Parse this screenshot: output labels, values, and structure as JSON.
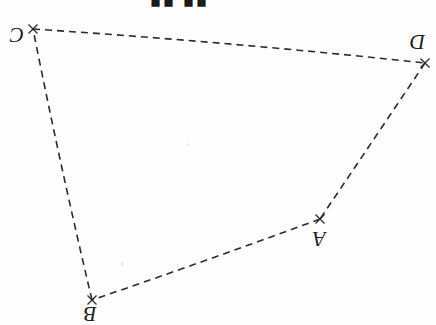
{
  "figure": {
    "title_fragment": "▮▮ ▮▮",
    "canvas": {
      "width": 436,
      "height": 325
    },
    "background_color": "#fefefe",
    "stroke_color": "#2b2b2b",
    "stroke_width": 1.6,
    "dash_pattern": "7 5",
    "marker_style": "x-cross",
    "label_rotation_degrees": 180,
    "vertices": [
      {
        "id": "A",
        "label": "A",
        "x": 320,
        "y": 219,
        "label_x": 313,
        "label_y": 228
      },
      {
        "id": "B",
        "label": "B",
        "x": 92,
        "y": 300,
        "label_x": 84,
        "label_y": 303
      },
      {
        "id": "C",
        "label": "C",
        "x": 33,
        "y": 29,
        "label_x": 10,
        "label_y": 24
      },
      {
        "id": "D",
        "label": "D",
        "x": 425,
        "y": 63,
        "label_x": 410,
        "label_y": 31
      }
    ],
    "edges": [
      {
        "from": "C",
        "to": "D",
        "path": "M 33 29 Q 230 42 425 63"
      },
      {
        "from": "D",
        "to": "A",
        "path": "M 425 63 Q 372 142 320 219"
      },
      {
        "from": "A",
        "to": "B",
        "path": "M 320 219 Q 206 261 92 300"
      },
      {
        "from": "B",
        "to": "C",
        "path": "M 92 300 Q 60 165 33 29"
      }
    ]
  }
}
